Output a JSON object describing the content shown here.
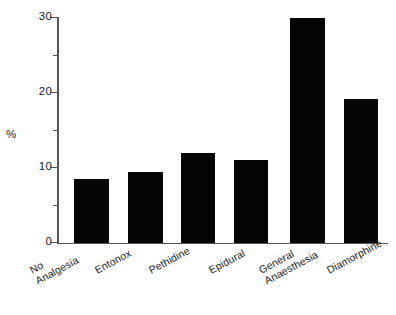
{
  "chart_data": {
    "type": "bar",
    "title": "",
    "xlabel": "",
    "ylabel": "%",
    "categories": [
      "No\nAnalgesia",
      "Entonox",
      "Pethidine",
      "Epidural",
      "General\nAnaesthesia",
      "Diamorphine"
    ],
    "values": [
      8.5,
      9.4,
      12.0,
      11.0,
      30.0,
      19.2
    ],
    "ylim": [
      0,
      30
    ],
    "yticks": [
      0,
      10,
      20,
      30
    ],
    "ytick_labels": [
      "0",
      "10",
      "20",
      "30"
    ],
    "yminor_ticks": [
      5,
      15,
      25
    ],
    "grid": false,
    "legend": null,
    "bar_color": "#050505",
    "axis_color": "#555555"
  },
  "axis": {
    "y_title": "%",
    "tick_labels": [
      "30",
      "20",
      "10",
      "0"
    ]
  },
  "categories": [
    {
      "line1": "No",
      "line2": "Analgesia"
    },
    {
      "line1": "Entonox",
      "line2": ""
    },
    {
      "line1": "Pethidine",
      "line2": ""
    },
    {
      "line1": "Epidural",
      "line2": ""
    },
    {
      "line1": "General",
      "line2": "Anaesthesia"
    },
    {
      "line1": "Diamorphine",
      "line2": ""
    }
  ]
}
